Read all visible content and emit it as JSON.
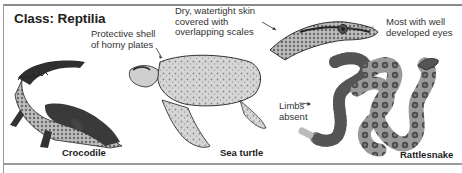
{
  "diagram": {
    "title": "Class: Reptilia",
    "annotations": {
      "shell": [
        "Protective shell",
        "of horny plates"
      ],
      "skin": [
        "Dry, watertight skin",
        "covered with",
        "overlapping scales"
      ],
      "eyes": [
        "Most with well",
        "developed eyes"
      ],
      "limbs": [
        "Limbs",
        "absent"
      ]
    },
    "animals": [
      {
        "name": "Crocodile"
      },
      {
        "name": "Sea turtle"
      },
      {
        "name": "Rattlesnake"
      }
    ],
    "colors": {
      "frame": "#8a8a8a",
      "text": "#222222",
      "ink": "#2b2b2b"
    }
  }
}
